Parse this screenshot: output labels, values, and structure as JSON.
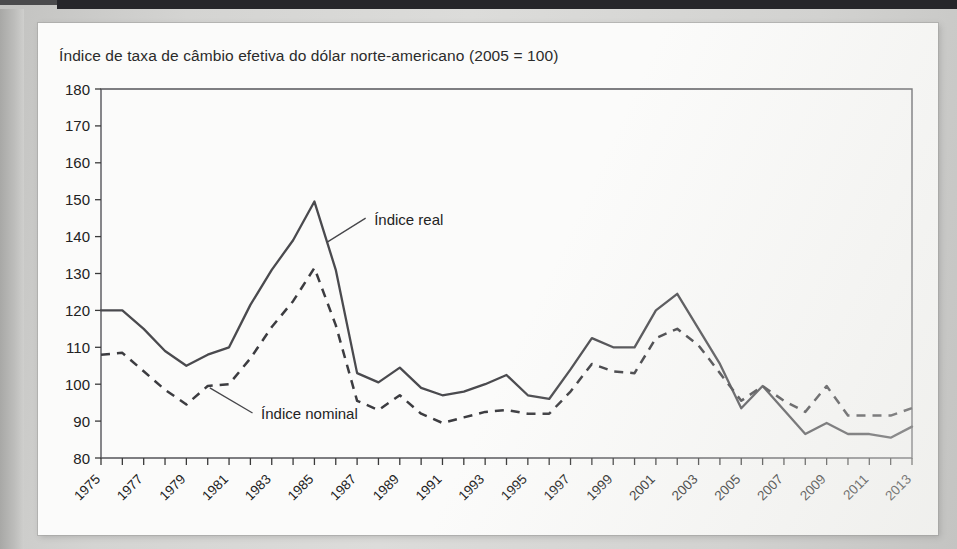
{
  "figure": {
    "title": "Índice de taxa de câmbio efetiva do dólar norte-americano (2005 = 100)",
    "annotations": {
      "real": "Índice real",
      "nominal": "Índice nominal"
    }
  },
  "chart_data": {
    "type": "line",
    "title": "Índice de taxa de câmbio efetiva do dólar norte-americano (2005 = 100)",
    "xlabel": "",
    "ylabel": "",
    "ylim": [
      80,
      180
    ],
    "ytick_step": 10,
    "yticks": [
      80,
      90,
      100,
      110,
      120,
      130,
      140,
      150,
      160,
      170,
      180
    ],
    "xlim": [
      1975,
      2013
    ],
    "x": [
      1975,
      1976,
      1977,
      1978,
      1979,
      1980,
      1981,
      1982,
      1983,
      1984,
      1985,
      1986,
      1987,
      1988,
      1989,
      1990,
      1991,
      1992,
      1993,
      1994,
      1995,
      1996,
      1997,
      1998,
      1999,
      2000,
      2001,
      2002,
      2003,
      2004,
      2005,
      2006,
      2007,
      2008,
      2009,
      2010,
      2011,
      2012,
      2013
    ],
    "xtick_labels": [
      "1975",
      "1977",
      "1979",
      "1981",
      "1983",
      "1985",
      "1987",
      "1989",
      "1991",
      "1993",
      "1995",
      "1997",
      "1999",
      "2001",
      "2003",
      "2005",
      "2007",
      "2009",
      "2011",
      "2013"
    ],
    "xtick_label_every": 2,
    "xtick_rotation": -45,
    "grid": false,
    "legend": "inline-annotations",
    "series": [
      {
        "name": "Índice real",
        "style": "solid",
        "color": "#4a4a4e",
        "values": [
          120.0,
          120.0,
          115.0,
          109.0,
          105.0,
          108.0,
          110.0,
          121.5,
          131.0,
          139.0,
          149.5,
          131.0,
          103.0,
          100.5,
          104.5,
          99.0,
          97.0,
          98.0,
          100.0,
          102.5,
          97.0,
          96.0,
          104.0,
          112.5,
          110.0,
          110.0,
          120.0,
          124.5,
          115.0,
          105.5,
          93.5,
          99.5,
          93.0,
          86.5,
          89.5,
          86.5,
          86.5,
          85.5,
          88.5
        ]
      },
      {
        "name": "Índice nominal",
        "style": "dashed",
        "color": "#3c3c40",
        "values": [
          108.0,
          108.5,
          103.5,
          98.5,
          94.5,
          99.5,
          100.0,
          107.0,
          115.5,
          122.5,
          131.5,
          116.0,
          95.5,
          93.0,
          97.0,
          92.0,
          89.5,
          91.0,
          92.5,
          93.0,
          92.0,
          92.0,
          98.0,
          105.5,
          103.5,
          103.0,
          112.5,
          115.0,
          110.5,
          103.0,
          95.5,
          99.5,
          95.5,
          92.5,
          99.5,
          91.5,
          91.5,
          91.5,
          93.5
        ]
      }
    ]
  }
}
